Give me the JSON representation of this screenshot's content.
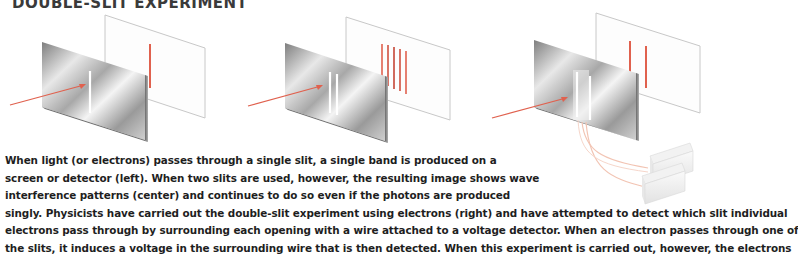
{
  "title": "DOUBLE-SLIT EXPERIMENT",
  "figure": {
    "panels": [
      {
        "name": "single-slit",
        "position": "left",
        "slits": 1,
        "screen_bands": 1
      },
      {
        "name": "double-slit",
        "position": "center",
        "slits": 2,
        "screen_bands": 5
      },
      {
        "name": "double-slit-with-detectors",
        "position": "right",
        "slits": 2,
        "screen_bands": 2,
        "detectors": 2
      }
    ],
    "colors": {
      "beam": "#e0614e",
      "band": "#e0614e",
      "wire": "#f2c4b3",
      "plate_dark": "#8a8a8a",
      "plate_light": "#f2f2f2"
    }
  },
  "caption": {
    "lines": [
      "When light (or electrons) passes through a single slit, a single band is produced on a",
      "screen or detector (left). When two slits are used, however, the resulting image shows wave",
      "interference patterns (center) and continues to do so even if the photons are produced",
      "singly. Physicists have carried out the double-slit experiment using electrons (right) and have attempted to detect which slit individual",
      "electrons pass through by surrounding each opening with a wire attached to a voltage detector. When an electron passes through one of",
      "the slits, it induces a voltage in the surrounding wire that is then detected. When this experiment is carried out, however, the electrons"
    ]
  }
}
